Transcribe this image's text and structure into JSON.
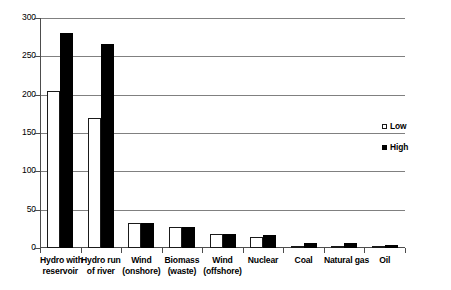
{
  "chart_data": {
    "type": "bar",
    "title": "",
    "subtitle": "",
    "xlabel": "",
    "ylabel": "",
    "ylim": [
      0,
      300
    ],
    "yticks": [
      0,
      50,
      100,
      150,
      200,
      250,
      300
    ],
    "ytick_labels": [
      "0",
      "50",
      "100",
      "150",
      "200",
      "250",
      "300"
    ],
    "grid": true,
    "grid_axis": "y",
    "legend_position": "center-right",
    "categories": [
      "Hydro with reservoir",
      "Hydro run of river",
      "Wind (onshore)",
      "Biomass (waste)",
      "Wind (offshore)",
      "Nuclear",
      "Coal",
      "Natural gas",
      "Oil"
    ],
    "category_lines": [
      [
        "Hydro with",
        "reservoir"
      ],
      [
        "Hydro run",
        "of river"
      ],
      [
        "Wind",
        "(onshore)"
      ],
      [
        "Biomass",
        "(waste)"
      ],
      [
        "Wind",
        "(offshore)"
      ],
      [
        "Nuclear"
      ],
      [
        "Coal"
      ],
      [
        "Natural gas"
      ],
      [
        "Oil"
      ]
    ],
    "series": [
      {
        "name": "Low",
        "color": "#ffffff",
        "edge_color": "#1a1a1a",
        "values": [
          205,
          170,
          33,
          27,
          18,
          14,
          3,
          3,
          2
        ]
      },
      {
        "name": "High",
        "color": "#000000",
        "edge_color": "#000000",
        "values": [
          280,
          266,
          33,
          27,
          18,
          17,
          6,
          7,
          4
        ]
      }
    ]
  },
  "legend": {
    "items": [
      {
        "label": "Low",
        "swatch": "hollow-square-swatch"
      },
      {
        "label": "High",
        "swatch": "filled-square-swatch"
      }
    ]
  }
}
